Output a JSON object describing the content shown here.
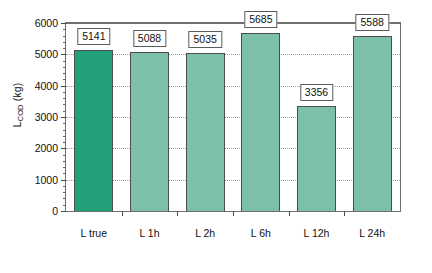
{
  "chart_data": {
    "type": "bar",
    "title": "",
    "xlabel": "",
    "ylabel": "L_COD (kg)",
    "ylabel_base": "L",
    "ylabel_sub": "COD",
    "ylabel_unit": " (kg)",
    "categories": [
      "L true",
      "L 1h",
      "L 2h",
      "L 6h",
      "L 12h",
      "L 24h"
    ],
    "values": [
      5141,
      5088,
      5035,
      5685,
      3356,
      5588
    ],
    "value_labels": [
      "5141",
      "5088",
      "5035",
      "5685",
      "3356",
      "5588"
    ],
    "bar_colors": [
      "#22a079",
      "#7cbfab",
      "#7cbfab",
      "#7cbfab",
      "#7cbfab",
      "#7cbfab"
    ],
    "bar_border_color": "#4d4d4d",
    "ylim": [
      0,
      6000
    ],
    "ytick_values": [
      0,
      1000,
      2000,
      3000,
      4000,
      5000,
      6000
    ],
    "ytick_labels": [
      "0",
      "1000",
      "2000",
      "3000",
      "4000",
      "5000",
      "6000"
    ],
    "yminor_step": 200,
    "grid": true,
    "grid_style": "dotted",
    "grid_color": "#9aa3a8",
    "legend": "none",
    "frame_color": "#6f6f6f",
    "background": "#ffffff"
  }
}
